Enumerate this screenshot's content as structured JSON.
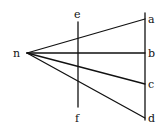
{
  "diagram": {
    "stroke_color": "#111111",
    "background": "#ffffff",
    "points": {
      "n": {
        "label": "n",
        "x": 27,
        "y": 53
      },
      "a": {
        "label": "a",
        "x": 145,
        "y": 19
      },
      "b": {
        "label": "b",
        "x": 145,
        "y": 53
      },
      "c": {
        "label": "c",
        "x": 145,
        "y": 84
      },
      "d": {
        "label": "d",
        "x": 145,
        "y": 118
      },
      "e": {
        "label": "e",
        "x": 78,
        "y": 22
      },
      "f": {
        "label": "f",
        "x": 78,
        "y": 107
      }
    },
    "lines": [
      {
        "from": "n",
        "to": "a"
      },
      {
        "from": "n",
        "to": "b"
      },
      {
        "from": "n",
        "to": "c"
      },
      {
        "from": "n",
        "to": "d"
      },
      {
        "from": "e",
        "to": "f",
        "kind": "vertical"
      },
      {
        "from": "a-top",
        "to": "d",
        "kind": "vertical"
      }
    ],
    "labels": [
      "n",
      "e",
      "f",
      "a",
      "b",
      "c",
      "d"
    ]
  }
}
